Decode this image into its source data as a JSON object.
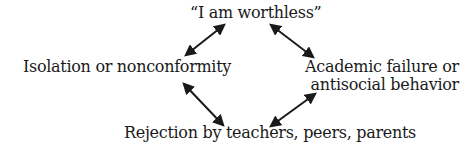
{
  "diagram": {
    "type": "cycle",
    "nodes": {
      "top": "“I am worthless”",
      "left": "Isolation or nonconformity",
      "right_line1": "Academic  failure or",
      "right_line2": "antisocial behavior",
      "bottom": "Rejection by teachers, peers, parents"
    },
    "edges": [
      {
        "from": "top",
        "to": "left",
        "style": "double-headed arrow"
      },
      {
        "from": "top",
        "to": "right",
        "style": "double-headed arrow"
      },
      {
        "from": "left",
        "to": "bottom",
        "style": "double-headed arrow"
      },
      {
        "from": "right",
        "to": "bottom",
        "style": "double-headed arrow"
      }
    ],
    "colors": {
      "text": "#1a1a1a",
      "arrow": "#1a1a1a",
      "background": "#ffffff"
    }
  }
}
